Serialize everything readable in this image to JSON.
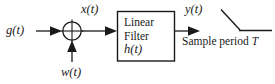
{
  "diagram": {
    "background_color": "#ffffff",
    "line_color": "#1a1a1a",
    "labels": {
      "input_signal": "g(t)",
      "filter_input": "x(t)",
      "noise": "w(t)",
      "filter_output": "y(t)",
      "sample_period": "Sample period ",
      "sample_period_symbol": "T"
    },
    "filter_block": {
      "line1": "Linear",
      "line2": "Filter",
      "line3": "h(t)"
    },
    "summing_junction": {
      "symbol": "+",
      "shape": "circle-with-cross"
    },
    "switch": {
      "name": "sampling-switch",
      "state": "open"
    }
  }
}
